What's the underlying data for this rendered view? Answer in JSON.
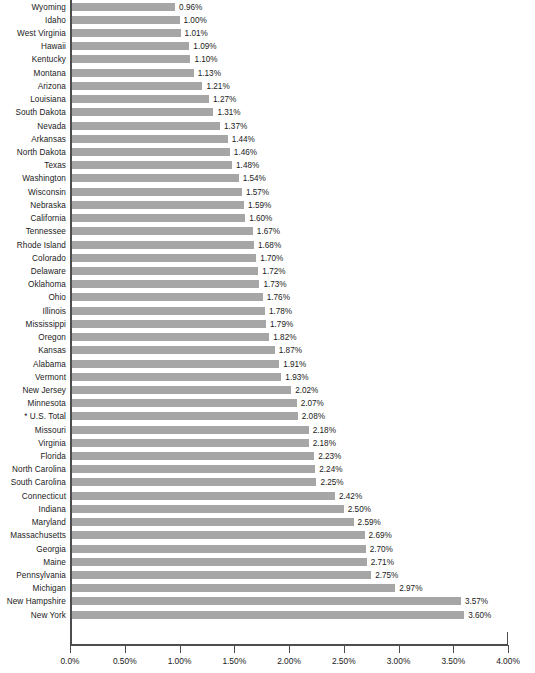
{
  "chart_data": {
    "type": "bar",
    "orientation": "horizontal",
    "title": "",
    "subtitle": "",
    "xlabel": "",
    "ylabel": "",
    "xlim": [
      0,
      4
    ],
    "xtick_labels": [
      "0.0%",
      "0.50%",
      "1.00%",
      "1.50%",
      "2.00%",
      "2.50%",
      "3.00%",
      "3.50%",
      "4.00%"
    ],
    "xticks": [
      0,
      0.5,
      1.0,
      1.5,
      2.0,
      2.5,
      3.0,
      3.5,
      4.0
    ],
    "grid": false,
    "legend": null,
    "bar_color": "#a6a6a6",
    "axis_color": "#4d4d4d",
    "value_label_suffix": "%",
    "categories": [
      "Wyoming",
      "Idaho",
      "West Virginia",
      "Hawaii",
      "Kentucky",
      "Montana",
      "Arizona",
      "Louisiana",
      "South Dakota",
      "Nevada",
      "Arkansas",
      "North Dakota",
      "Texas",
      "Washington",
      "Wisconsin",
      "Nebraska",
      "California",
      "Tennessee",
      "Rhode Island",
      "Colorado",
      "Delaware",
      "Oklahoma",
      "Ohio",
      "Illinois",
      "Mississippi",
      "Oregon",
      "Kansas",
      "Alabama",
      "Vermont",
      "New Jersey",
      "Minnesota",
      "* U.S. Total",
      "Missouri",
      "Virginia",
      "Florida",
      "North Carolina",
      "South Carolina",
      "Connecticut",
      "Indiana",
      "Maryland",
      "Massachusetts",
      "Georgia",
      "Maine",
      "Pennsylvania",
      "Michigan",
      "New Hampshire",
      "New York"
    ],
    "values": [
      0.96,
      1.0,
      1.01,
      1.09,
      1.1,
      1.13,
      1.21,
      1.27,
      1.31,
      1.37,
      1.44,
      1.46,
      1.48,
      1.54,
      1.57,
      1.59,
      1.6,
      1.67,
      1.68,
      1.7,
      1.72,
      1.73,
      1.76,
      1.78,
      1.79,
      1.82,
      1.87,
      1.91,
      1.93,
      2.02,
      2.07,
      2.08,
      2.18,
      2.18,
      2.23,
      2.24,
      2.25,
      2.42,
      2.5,
      2.59,
      2.69,
      2.7,
      2.71,
      2.75,
      2.97,
      3.57,
      3.6
    ],
    "value_labels": [
      "0.96%",
      "1.00%",
      "1.01%",
      "1.09%",
      "1.10%",
      "1.13%",
      "1.21%",
      "1.27%",
      "1.31%",
      "1.37%",
      "1.44%",
      "1.46%",
      "1.48%",
      "1.54%",
      "1.57%",
      "1.59%",
      "1.60%",
      "1.67%",
      "1.68%",
      "1.70%",
      "1.72%",
      "1.73%",
      "1.76%",
      "1.78%",
      "1.79%",
      "1.82%",
      "1.87%",
      "1.91%",
      "1.93%",
      "2.02%",
      "2.07%",
      "2.08%",
      "2.18%",
      "2.18%",
      "2.23%",
      "2.24%",
      "2.25%",
      "2.42%",
      "2.50%",
      "2.59%",
      "2.69%",
      "2.70%",
      "2.71%",
      "2.75%",
      "2.97%",
      "3.57%",
      "3.60%"
    ]
  }
}
